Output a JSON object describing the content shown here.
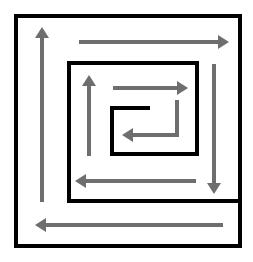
{
  "diagram": {
    "type": "square-spiral",
    "colors": {
      "wall": "#000000",
      "arrow": "#6e6e6e",
      "background": "#ffffff"
    },
    "walls": [
      {
        "id": "outer-box",
        "points": [
          [
            16,
            16
          ],
          [
            240,
            16
          ],
          [
            240,
            246
          ],
          [
            16,
            246
          ],
          [
            16,
            16
          ]
        ]
      },
      {
        "id": "inner-box",
        "points": [
          [
            240,
            201
          ],
          [
            69,
            201
          ],
          [
            69,
            63
          ],
          [
            197,
            63
          ],
          [
            197,
            154
          ],
          [
            112,
            154
          ],
          [
            112,
            108
          ],
          [
            148,
            108
          ]
        ]
      }
    ],
    "arrows": [
      {
        "id": "outer-up",
        "direction": "up",
        "points": [
          [
            42,
            202
          ],
          [
            42,
            27
          ]
        ]
      },
      {
        "id": "outer-right",
        "direction": "right",
        "points": [
          [
            79,
            42
          ],
          [
            229,
            42
          ]
        ]
      },
      {
        "id": "outer-down",
        "direction": "down",
        "points": [
          [
            214,
            64
          ],
          [
            214,
            194
          ]
        ]
      },
      {
        "id": "outer-left",
        "direction": "left",
        "points": [
          [
            223,
            225
          ],
          [
            35,
            225
          ]
        ]
      },
      {
        "id": "inner-up",
        "direction": "up",
        "points": [
          [
            89,
            156
          ],
          [
            89,
            75
          ]
        ]
      },
      {
        "id": "inner-right",
        "direction": "right",
        "points": [
          [
            113,
            88
          ],
          [
            188,
            88
          ]
        ]
      },
      {
        "id": "inner-down-left",
        "direction": "left",
        "points": [
          [
            177,
            100
          ],
          [
            177,
            135
          ],
          [
            122,
            135
          ]
        ]
      },
      {
        "id": "inner-left",
        "direction": "left",
        "points": [
          [
            196,
            181
          ],
          [
            75,
            181
          ]
        ]
      }
    ]
  }
}
